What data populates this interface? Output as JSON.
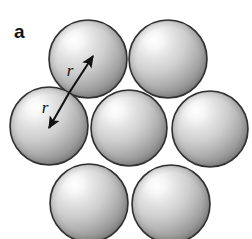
{
  "figure": {
    "panel_label": "a",
    "background_color": "#ffffff",
    "width": 252,
    "height": 239
  },
  "colors": {
    "sphere_highlight": "#fdfdfd",
    "sphere_midtone": "#d2d2d2",
    "sphere_shadow": "#8e8e8e",
    "sphere_edge_shadow": "#777777",
    "sphere_outline": "#343434",
    "annotation": "#111111",
    "label": "#141414"
  },
  "spheres": [
    {
      "name": "top-left",
      "cx": 88,
      "cy": 59,
      "r": 39
    },
    {
      "name": "top-right",
      "cx": 168,
      "cy": 59,
      "r": 39
    },
    {
      "name": "middle-left",
      "cx": 49,
      "cy": 126,
      "r": 39
    },
    {
      "name": "middle-center",
      "cx": 129,
      "cy": 128,
      "r": 38
    },
    {
      "name": "middle-right",
      "cx": 210,
      "cy": 129,
      "r": 38
    },
    {
      "name": "bottom-left",
      "cx": 89,
      "cy": 203,
      "r": 39
    },
    {
      "name": "bottom-right",
      "cx": 171,
      "cy": 204,
      "r": 39
    }
  ],
  "annotations": {
    "junction": {
      "x": 69,
      "y": 93
    },
    "arrows": [
      {
        "name": "upper-radius-arrow",
        "label": "r",
        "from_x": 69,
        "from_y": 93,
        "to_x": 93,
        "to_y": 56,
        "label_x": 70,
        "label_y": 76
      },
      {
        "name": "lower-radius-arrow",
        "label": "r",
        "from_x": 69,
        "from_y": 93,
        "to_x": 49,
        "to_y": 128,
        "label_x": 45,
        "label_y": 113
      }
    ]
  },
  "icons": {
    "arrowhead": "arrowhead-icon"
  }
}
